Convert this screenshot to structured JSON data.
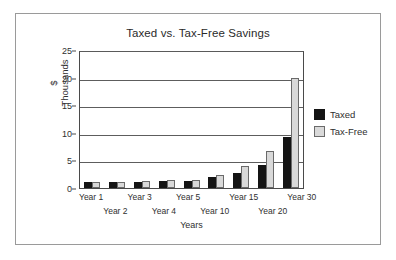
{
  "chart_data": {
    "type": "bar",
    "title": "Taxed vs. Tax-Free Savings",
    "xlabel": "Years",
    "ylabel_line1": "$",
    "ylabel_line2": "Thousands",
    "categories": [
      "Year 1",
      "Year 2",
      "Year 3",
      "Year 4",
      "Year 5",
      "Year 10",
      "Year 15",
      "Year 20",
      "Year 30"
    ],
    "series": [
      {
        "name": "Taxed",
        "color": "#141414",
        "values": [
          1.0,
          1.05,
          1.15,
          1.25,
          1.35,
          2.0,
          2.7,
          4.1,
          9.2
        ]
      },
      {
        "name": "Tax-Free",
        "color": "#d9d9d9",
        "values": [
          1.05,
          1.15,
          1.3,
          1.4,
          1.5,
          2.4,
          4.0,
          6.7,
          20.0
        ]
      }
    ],
    "ylim": [
      0,
      25
    ],
    "yticks": [
      0,
      5,
      10,
      15,
      20,
      25
    ],
    "ytick_labels": [
      "0",
      "5",
      "10",
      "15",
      "20",
      "25"
    ],
    "grid": "horizontal",
    "legend_position": "right"
  },
  "legend": {
    "items": [
      {
        "label": "Taxed"
      },
      {
        "label": "Tax-Free"
      }
    ]
  }
}
